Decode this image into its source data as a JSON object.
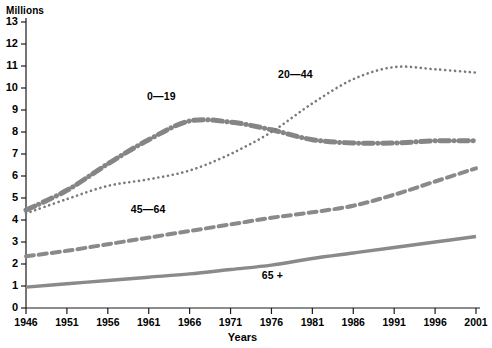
{
  "chart_data": {
    "type": "line",
    "title": "",
    "ylabel": "Millions",
    "xlabel": "Years",
    "ylim": [
      0,
      13
    ],
    "xlim": [
      1946,
      2001
    ],
    "grid": false,
    "legend_position": "inline-annotations",
    "y_ticks": [
      "0",
      "1",
      "2",
      "3",
      "4",
      "5",
      "6",
      "7",
      "8",
      "9",
      "10",
      "11",
      "12",
      "13"
    ],
    "x_ticks": [
      "1946",
      "1951",
      "1956",
      "1961",
      "1966",
      "1971",
      "1976",
      "1981",
      "1986",
      "1991",
      "1996",
      "2001"
    ],
    "x": [
      1946,
      1951,
      1956,
      1961,
      1966,
      1971,
      1976,
      1981,
      1986,
      1991,
      1996,
      2001
    ],
    "series": [
      {
        "name": "0—19",
        "style": "dash-dot",
        "color": "#858585",
        "width": 5,
        "label_x": 1963,
        "label_y": 9.6,
        "values": [
          4.45,
          5.35,
          6.55,
          7.65,
          8.5,
          8.45,
          8.1,
          7.65,
          7.5,
          7.5,
          7.6,
          7.6
        ]
      },
      {
        "name": "20—44",
        "style": "dotted",
        "color": "#7a7a7a",
        "width": 2.6,
        "label_x": 1979,
        "label_y": 10.6,
        "values": [
          4.3,
          4.95,
          5.55,
          5.85,
          6.25,
          7.0,
          8.0,
          9.3,
          10.4,
          10.95,
          10.85,
          10.7
        ]
      },
      {
        "name": "45—64",
        "style": "dashed",
        "color": "#8a8a8a",
        "width": 4,
        "label_x": 1961,
        "label_y": 4.45,
        "values": [
          2.35,
          2.6,
          2.9,
          3.2,
          3.5,
          3.8,
          4.1,
          4.35,
          4.65,
          5.15,
          5.75,
          6.35
        ]
      },
      {
        "name": "65 +",
        "style": "solid",
        "color": "#8a8a8a",
        "width": 3.4,
        "label_x": 1977,
        "label_y": 1.45,
        "values": [
          0.95,
          1.1,
          1.25,
          1.4,
          1.55,
          1.75,
          1.95,
          2.25,
          2.5,
          2.75,
          3.0,
          3.25
        ]
      }
    ]
  }
}
